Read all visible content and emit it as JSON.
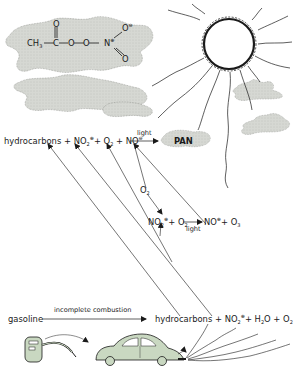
{
  "colors": {
    "cloud": "#d6d8d3",
    "cloud_stipple": "#8f918c",
    "car": "#c9d8c1",
    "ink": "#1a1a1a",
    "background": "#ffffff"
  },
  "pan_structure": {
    "ch3": "CH",
    "ch3_sub": "3",
    "carbon": "C",
    "oxygen_double": "O",
    "o1": "O",
    "o2": "O",
    "nitrogen": "N",
    "n_charge": "⊕",
    "o_top": "O",
    "o_top_charge": "⊖",
    "o_bottom": "O"
  },
  "reaction_top": {
    "hydrocarbons": "hydrocarbons",
    "plus1": "+",
    "no2": "NO",
    "no2_sub": "2",
    "no2_charge": "⊕",
    "plus2": "+",
    "o2": "O",
    "o2_sub": "2",
    "plus3": "+",
    "no": "NO",
    "no_charge": "⊖",
    "arrow_label": "light",
    "product": "PAN"
  },
  "reaction_middle": {
    "o2_label": "O",
    "o2_label_sub": "2",
    "no2": "NO",
    "no2_sub": "2",
    "no2_charge": "⊕",
    "plus1": "+",
    "o2": "O",
    "o2_sub": "2",
    "arrow_label": "light",
    "no": "NO",
    "no_charge": "⊕",
    "plus2": "+",
    "o3": "O",
    "o3_sub": "3"
  },
  "reaction_bottom": {
    "gasoline": "gasoline",
    "arrow_label": "incomplete combustion",
    "hydrocarbons": "hydrocarbons",
    "plus1": "+",
    "no2": "NO",
    "no2_sub": "2",
    "no2_charge": "⊕",
    "plus2": "+",
    "h2o_h": "H",
    "h2o_sub": "2",
    "h2o_o": "O",
    "plus3": "+",
    "o2": "O",
    "o2_sub": "2"
  },
  "icons": {
    "sun": "sun-icon",
    "cloud": "cloud-icon",
    "gas_pump": "gas-pump-icon",
    "car": "car-icon",
    "exhaust": "exhaust-fumes-icon"
  }
}
